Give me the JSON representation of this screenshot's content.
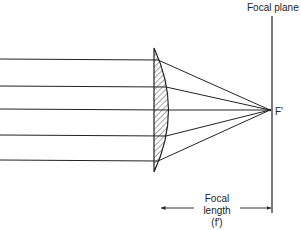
{
  "diagram": {
    "labels": {
      "focal_plane": "Focal plane",
      "focal_point": "F'",
      "focal_length_line1": "Focal",
      "focal_length_line2": "length",
      "focal_length_line3": "(f')"
    },
    "elements": {
      "incoming_rays": 5,
      "lens": "plano-convex lens (hatched)",
      "focal_plane": "vertical line through F'",
      "dimension_arrow": "focal length from lens to focal plane"
    },
    "colors": {
      "line": "#222222",
      "background": "#ffffff"
    }
  }
}
